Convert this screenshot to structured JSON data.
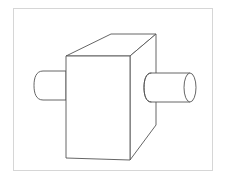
{
  "figure": {
    "caption": "",
    "colors": {
      "background": "#ffffff",
      "frame_border": "#d6d6d6",
      "line": "#555555"
    },
    "shapes": [
      {
        "name": "block",
        "type": "rectangular-prism"
      },
      {
        "name": "left-rod",
        "type": "cylinder"
      },
      {
        "name": "right-rod",
        "type": "cylinder"
      }
    ]
  }
}
